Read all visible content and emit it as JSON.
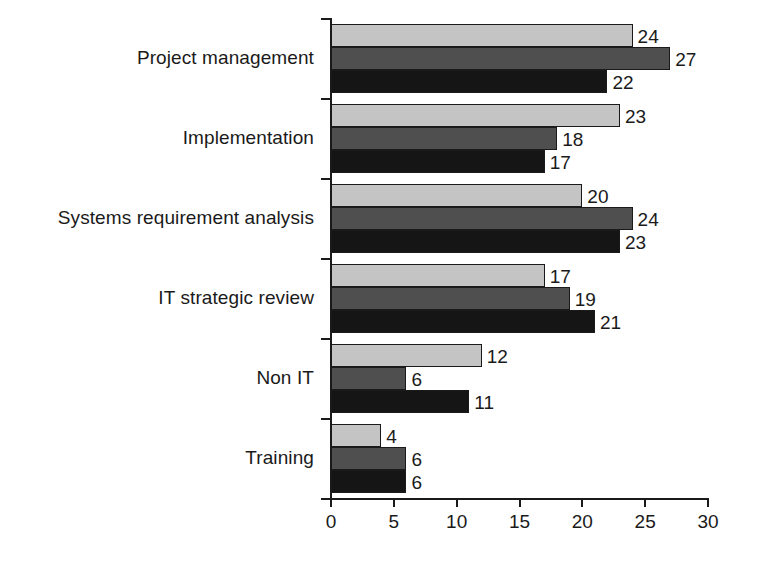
{
  "chart_data": {
    "type": "bar",
    "orientation": "horizontal",
    "title": "",
    "subtitle": "",
    "xlabel": "",
    "ylabel": "",
    "xlim": [
      0,
      30
    ],
    "xticks": [
      0,
      5,
      10,
      15,
      20,
      25,
      30
    ],
    "xtick_labels": [
      "0",
      "5",
      "10",
      "15",
      "20",
      "25",
      "30"
    ],
    "grid": false,
    "legend": "none",
    "categories": [
      "Project management",
      "Implementation",
      "Systems requirement analysis",
      "IT strategic review",
      "Non IT",
      "Training"
    ],
    "series": [
      {
        "name": "series-1",
        "color": "#c4c4c4",
        "values": [
          24,
          23,
          20,
          17,
          12,
          4
        ]
      },
      {
        "name": "series-2",
        "color": "#4f4f4f",
        "values": [
          27,
          18,
          24,
          19,
          6,
          6
        ]
      },
      {
        "name": "series-3",
        "color": "#151515",
        "values": [
          22,
          17,
          23,
          21,
          11,
          6
        ]
      }
    ],
    "data_labels": [
      [
        "24",
        "27",
        "22"
      ],
      [
        "23",
        "18",
        "17"
      ],
      [
        "20",
        "24",
        "23"
      ],
      [
        "17",
        "19",
        "21"
      ],
      [
        "12",
        "6",
        "11"
      ],
      [
        "4",
        "6",
        "6"
      ]
    ]
  },
  "colors": {
    "axis": "#1a1a1a",
    "text": "#1a1a1a",
    "background": "#ffffff",
    "series_1": "#c4c4c4",
    "series_2": "#4f4f4f",
    "series_3": "#151515"
  }
}
